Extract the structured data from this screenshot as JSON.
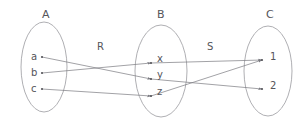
{
  "diagram": {
    "title_note": "Composition of relations R and S between sets A, B and C",
    "sets": [
      {
        "id": "A",
        "label": "A",
        "label_x": 42,
        "label_y": 8,
        "cx": 44,
        "cy": 67,
        "rx": 23,
        "ry": 45,
        "elements": [
          {
            "id": "a",
            "label": "a",
            "x": 42,
            "y": 57,
            "label_x": 31,
            "label_y": 51
          },
          {
            "id": "b",
            "label": "b",
            "x": 42,
            "y": 73,
            "label_x": 31,
            "label_y": 67
          },
          {
            "id": "c",
            "label": "c",
            "x": 42,
            "y": 89,
            "label_x": 31,
            "label_y": 83
          }
        ]
      },
      {
        "id": "B",
        "label": "B",
        "label_x": 157,
        "label_y": 8,
        "cx": 161,
        "cy": 71,
        "rx": 26,
        "ry": 46,
        "elements": [
          {
            "id": "x",
            "label": "x",
            "x": 151,
            "y": 63,
            "label_x": 157,
            "label_y": 53
          },
          {
            "id": "y",
            "label": "y",
            "x": 151,
            "y": 79,
            "label_x": 157,
            "label_y": 69
          },
          {
            "id": "z",
            "label": "z",
            "x": 151,
            "y": 96,
            "label_x": 157,
            "label_y": 86
          }
        ]
      },
      {
        "id": "C",
        "label": "C",
        "label_x": 266,
        "label_y": 8,
        "cx": 268,
        "cy": 71,
        "rx": 24,
        "ry": 45,
        "elements": [
          {
            "id": "1",
            "label": "1",
            "x": 262,
            "y": 60,
            "label_x": 270,
            "label_y": 51
          },
          {
            "id": "2",
            "label": "2",
            "x": 262,
            "y": 89,
            "label_x": 270,
            "label_y": 80
          }
        ]
      }
    ],
    "relations": [
      {
        "id": "R",
        "label": "R",
        "label_x": 97,
        "label_y": 41,
        "pairs": [
          {
            "from": "a",
            "to": "y",
            "x1": 42,
            "y1": 57,
            "x2": 151,
            "y2": 79
          },
          {
            "from": "b",
            "to": "x",
            "x1": 42,
            "y1": 73,
            "x2": 151,
            "y2": 63
          },
          {
            "from": "c",
            "to": "z",
            "x1": 42,
            "y1": 89,
            "x2": 151,
            "y2": 96
          }
        ]
      },
      {
        "id": "S",
        "label": "S",
        "label_x": 207,
        "label_y": 41,
        "pairs": [
          {
            "from": "x",
            "to": "1",
            "x1": 151,
            "y1": 63,
            "x2": 262,
            "y2": 60
          },
          {
            "from": "y",
            "to": "2",
            "x1": 151,
            "y1": 79,
            "x2": 262,
            "y2": 89
          },
          {
            "from": "z",
            "to": "1",
            "x1": 151,
            "y1": 96,
            "x2": 262,
            "y2": 60
          }
        ]
      }
    ],
    "colors": {
      "ellipse_stroke": "#9a9aa0",
      "edge_stroke": "#7a7a80",
      "text": "#55555a",
      "background": "#ffffff"
    }
  }
}
